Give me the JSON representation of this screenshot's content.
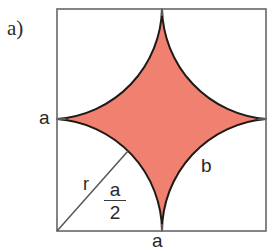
{
  "figure": {
    "panel_label": "a)",
    "shape_name": "astroid",
    "labels": {
      "side_left": "a",
      "side_bottom": "a",
      "arc": "b",
      "radius": "r",
      "half_side_numerator": "a",
      "half_side_denominator": "2"
    },
    "colors": {
      "shape_fill": "#f08070",
      "shape_stroke": "#1f1a18",
      "square_stroke": "#707070",
      "radius_line": "#555555",
      "text": "#282828",
      "background": "#ffffff"
    },
    "geometry": {
      "square": {
        "left": 57,
        "top": 9,
        "right": 266,
        "bottom": 231
      },
      "cusps": {
        "top": [
          162,
          9
        ],
        "right": [
          266,
          119
        ],
        "bottom": [
          162,
          231
        ],
        "left": [
          57,
          119
        ]
      },
      "radius_line": {
        "from": [
          57,
          231
        ],
        "to": [
          128,
          151
        ]
      }
    }
  }
}
